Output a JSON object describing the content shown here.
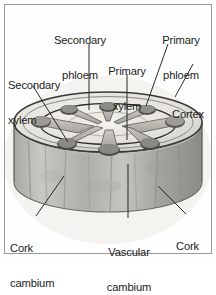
{
  "figure": {
    "frame_color": "#9a9a9a",
    "background_color": "#fefefe",
    "text_color": "#1c1c1c",
    "leader_color": "#2b2b2b"
  },
  "labels": [
    {
      "id": "secondary-phloem",
      "line1": "Secondary",
      "line2": "phloem"
    },
    {
      "id": "primary-phloem",
      "line1": "Primary",
      "line2": "phloem"
    },
    {
      "id": "secondary-xylem",
      "line1": "Secondary",
      "line2": "xylem"
    },
    {
      "id": "primary-xylem",
      "line1": "Primary",
      "line2": "xylem"
    },
    {
      "id": "cortex",
      "line1": "Cortex",
      "line2": ""
    },
    {
      "id": "cork-cambium",
      "line1": "Cork",
      "line2": "cambium"
    },
    {
      "id": "vascular-cambium",
      "line1": "Vascular",
      "line2": "cambium"
    },
    {
      "id": "cork",
      "line1": "Cork",
      "line2": ""
    }
  ],
  "diagram": {
    "stem_top_fill": "#e9e7e2",
    "stem_pith_fill": "#efeeea",
    "stem_wall_fill": "#b9b7b2",
    "bundle_fill": "#b6b3ad",
    "bundle_cap_fill": "#4a4845",
    "outline_color": "#3a3835",
    "bundle_count": 8,
    "cambium_ring_color": "#2e2c2a"
  }
}
